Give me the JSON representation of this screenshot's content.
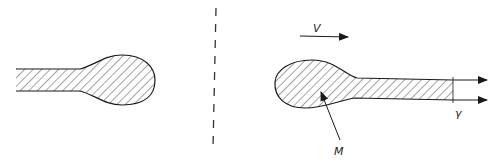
{
  "diagram": {
    "labels": {
      "velocity": "V",
      "mass": "M",
      "surface_tension": "γ"
    },
    "colors": {
      "stroke": "#1a1a1a",
      "hatch": "#333333",
      "background": "#ffffff"
    },
    "elements": [
      {
        "id": "left-drop",
        "type": "hatched-shape"
      },
      {
        "id": "dividing-line",
        "type": "dashed-vertical-line"
      },
      {
        "id": "right-drop",
        "type": "hatched-shape"
      },
      {
        "id": "velocity-arrow",
        "label": "V"
      },
      {
        "id": "jet-arrows",
        "count": 2,
        "label": "γ"
      },
      {
        "id": "mass-pointer",
        "label": "M"
      }
    ]
  }
}
